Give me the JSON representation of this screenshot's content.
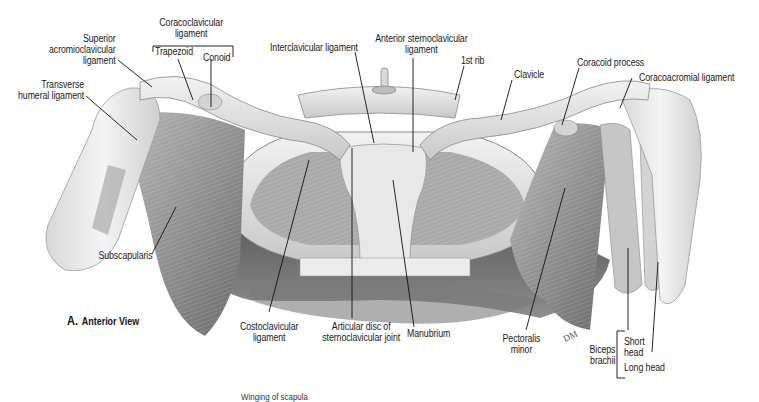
{
  "figure": {
    "caption_letter": "A.",
    "caption_text": "Anterior View",
    "partial_bottom_text": "Winging of scapula"
  },
  "labels": {
    "coracoclavicular_ligament": [
      "Coracoclavicular",
      "ligament"
    ],
    "trapezoid": "Trapezoid",
    "conoid": "Conoid",
    "superior_acromioclavicular_ligament": [
      "Superior",
      "acromioclavicular",
      "ligament"
    ],
    "transverse_humeral_ligament": [
      "Transverse",
      "humeral ligament"
    ],
    "interclavicular_ligament": "Interclavicular ligament",
    "anterior_sternoclavicular_ligament": [
      "Anterior sternoclavicular",
      "ligament"
    ],
    "first_rib": "1st rib",
    "clavicle": "Clavicle",
    "coracoid_process": "Coracoid process",
    "coracoacromial_ligament": "Coracoacromial ligament",
    "subscapularis": "Subscapularis",
    "costoclavicular_ligament": [
      "Costoclavicular",
      "ligament"
    ],
    "articular_disc": [
      "Articular disc of",
      "sternoclavicular joint"
    ],
    "manubrium": "Manubrium",
    "pectoralis_minor": [
      "Pectoralis",
      "minor"
    ],
    "biceps_brachii": [
      "Biceps",
      "brachii"
    ],
    "short_head": [
      "Short",
      "head"
    ],
    "long_head": "Long head"
  },
  "colors": {
    "background": "#ffffff",
    "label_text": "#1a1a1a",
    "leader_line": "#111111",
    "bone_light": "#e6e6e6",
    "muscle_mid": "#9a9a9a",
    "shadow_dark": "#4a4a4a"
  },
  "artist_signature": "DM"
}
